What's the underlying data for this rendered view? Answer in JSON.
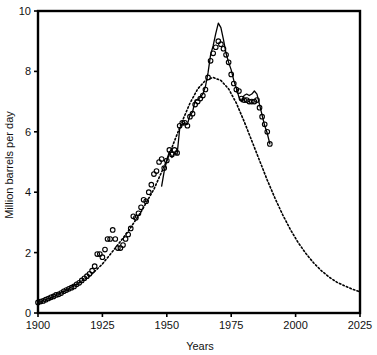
{
  "chart_data": {
    "type": "line",
    "title": "",
    "xlabel": "Years",
    "ylabel": "Million barrels per day",
    "xlim": [
      1900,
      2025
    ],
    "ylim": [
      0,
      10
    ],
    "xticks": [
      1900,
      1925,
      1950,
      1975,
      2000,
      2025
    ],
    "yticks": [
      0,
      2,
      4,
      6,
      8,
      10
    ],
    "grid": false,
    "legend_position": "none",
    "series": [
      {
        "name": "Hubbert curve fit",
        "style": "dotted",
        "color": "#000000",
        "x": [
          1900,
          1905,
          1910,
          1915,
          1920,
          1925,
          1930,
          1935,
          1940,
          1945,
          1950,
          1953,
          1956,
          1959,
          1962,
          1965,
          1968,
          1971,
          1974,
          1977,
          1980,
          1983,
          1986,
          1989,
          1992,
          1995,
          1998,
          2001,
          2004,
          2007,
          2010,
          2013,
          2016,
          2019,
          2022,
          2025
        ],
        "values": [
          0.35,
          0.5,
          0.72,
          0.95,
          1.22,
          1.62,
          2.15,
          2.7,
          3.35,
          4.1,
          5.05,
          5.7,
          6.35,
          6.95,
          7.42,
          7.7,
          7.8,
          7.7,
          7.42,
          6.95,
          6.35,
          5.7,
          5.05,
          4.4,
          3.8,
          3.25,
          2.76,
          2.33,
          1.97,
          1.66,
          1.4,
          1.19,
          1.02,
          0.9,
          0.79,
          0.7
        ]
      },
      {
        "name": "Actual U.S. crude oil production",
        "style": "solid",
        "color": "#000000",
        "x": [
          1948,
          1949,
          1950,
          1951,
          1952,
          1953,
          1954,
          1955,
          1956,
          1957,
          1958,
          1959,
          1960,
          1961,
          1962,
          1963,
          1964,
          1965,
          1966,
          1967,
          1968,
          1969,
          1970,
          1971,
          1972,
          1973,
          1974,
          1975,
          1976,
          1977,
          1978,
          1979,
          1980,
          1981,
          1982,
          1983,
          1984,
          1985,
          1986,
          1987,
          1988,
          1989,
          1990
        ],
        "values": [
          4.2,
          4.7,
          5.05,
          5.35,
          5.15,
          5.3,
          5.25,
          6.1,
          6.25,
          6.3,
          6.25,
          6.55,
          6.65,
          7.05,
          7.05,
          7.15,
          7.25,
          7.5,
          7.95,
          8.55,
          8.85,
          9.25,
          9.6,
          9.45,
          9.05,
          8.6,
          8.3,
          8.05,
          7.7,
          7.45,
          7.15,
          7.0,
          7.2,
          7.25,
          7.2,
          7.25,
          7.35,
          7.25,
          6.9,
          6.55,
          6.2,
          5.95,
          5.6
        ]
      },
      {
        "name": "Observed annual data points",
        "style": "circles",
        "color": "#000000",
        "x": [
          1900,
          1901,
          1902,
          1903,
          1904,
          1905,
          1906,
          1907,
          1908,
          1909,
          1910,
          1911,
          1912,
          1913,
          1914,
          1915,
          1916,
          1917,
          1918,
          1919,
          1920,
          1921,
          1922,
          1923,
          1924,
          1925,
          1926,
          1927,
          1928,
          1929,
          1930,
          1931,
          1932,
          1933,
          1934,
          1935,
          1936,
          1937,
          1938,
          1939,
          1940,
          1941,
          1942,
          1943,
          1944,
          1945,
          1946,
          1947,
          1948,
          1949,
          1950,
          1951,
          1952,
          1953,
          1954,
          1955,
          1956,
          1957,
          1958,
          1959,
          1960,
          1961,
          1962,
          1963,
          1964,
          1965,
          1966,
          1967,
          1968,
          1969,
          1970,
          1971,
          1972,
          1973,
          1974,
          1975,
          1976,
          1977,
          1978,
          1979,
          1980,
          1981,
          1982,
          1983,
          1984,
          1985,
          1986,
          1987,
          1988,
          1989,
          1990
        ],
        "values": [
          0.35,
          0.38,
          0.4,
          0.44,
          0.48,
          0.52,
          0.55,
          0.6,
          0.62,
          0.66,
          0.72,
          0.76,
          0.8,
          0.84,
          0.88,
          0.95,
          1.0,
          1.08,
          1.15,
          1.22,
          1.3,
          1.4,
          1.55,
          1.95,
          1.95,
          1.85,
          2.1,
          2.45,
          2.45,
          2.75,
          2.45,
          2.15,
          2.15,
          2.25,
          2.45,
          2.6,
          2.8,
          3.2,
          3.15,
          3.3,
          3.5,
          3.75,
          3.7,
          4.0,
          4.25,
          4.6,
          4.7,
          5.0,
          5.1,
          4.8,
          5.05,
          5.4,
          5.25,
          5.4,
          5.3,
          6.2,
          6.3,
          6.3,
          6.2,
          6.5,
          6.6,
          6.9,
          7.0,
          7.1,
          7.2,
          7.4,
          7.8,
          8.35,
          8.6,
          8.8,
          9.0,
          8.9,
          8.75,
          8.55,
          8.3,
          7.9,
          7.6,
          7.4,
          7.35,
          7.1,
          7.05,
          7.05,
          7.0,
          7.0,
          7.0,
          7.05,
          6.8,
          6.5,
          6.25,
          6.0,
          5.6
        ]
      }
    ]
  }
}
